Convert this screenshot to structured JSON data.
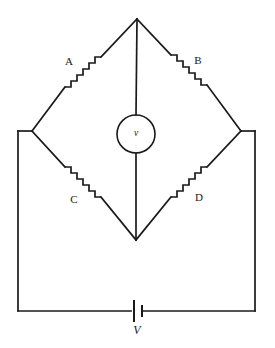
{
  "diagram": {
    "type": "circuit-schematic",
    "background_color": "#ffffff",
    "line_color": "#1a1a1a",
    "resistors": [
      {
        "id": "A",
        "label": "A",
        "position": "upper-left-arm",
        "label_x": 69,
        "label_y": 62
      },
      {
        "id": "B",
        "label": "B",
        "position": "upper-right-arm",
        "label_x": 198,
        "label_y": 61
      },
      {
        "id": "C",
        "label": "C",
        "position": "lower-left-arm",
        "label_x": 74,
        "label_y": 200
      },
      {
        "id": "D",
        "label": "D",
        "position": "lower-right-arm",
        "label_x": 199,
        "label_y": 198
      }
    ],
    "meter": {
      "label": "v",
      "type": "voltmeter",
      "center_x": 136,
      "center_y": 134,
      "radius": 19
    },
    "source": {
      "label": "V",
      "type": "battery",
      "label_x": 137,
      "label_y": 329
    },
    "nodes": {
      "top": {
        "x": 137,
        "y": 19
      },
      "left": {
        "x": 32,
        "y": 131
      },
      "right": {
        "x": 241,
        "y": 131
      },
      "bottom": {
        "x": 136,
        "y": 240
      }
    },
    "outer_loop": {
      "left_x": 18,
      "right_x": 255,
      "bottom_y": 311,
      "top_y": 131
    }
  }
}
